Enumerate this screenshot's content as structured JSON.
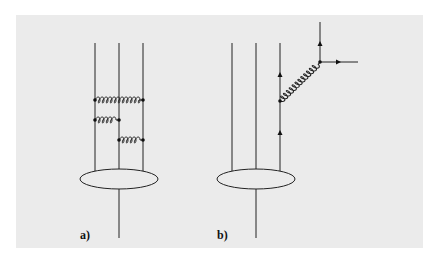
{
  "figure": {
    "background_color": "#ebebeb",
    "line_color": "#222222",
    "panels": [
      {
        "id": "a",
        "label": "a)",
        "description": "Three quark lines connected by gluon exchanges, attached to a hadron blob"
      },
      {
        "id": "b",
        "label": "b)",
        "description": "Three quark lines; one quark emits a gluon which splits into an outgoing quark-antiquark pair"
      }
    ]
  }
}
